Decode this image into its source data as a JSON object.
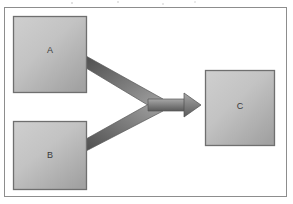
{
  "figure": {
    "type": "merge-flow-diagram",
    "frame": {
      "border_color": "#8d8d8d",
      "background_color": "#ffffff"
    },
    "nodes": [
      {
        "id": "A",
        "label": "A",
        "x": 13,
        "y": 16,
        "width": 74,
        "height": 77,
        "fill_light": "#c9c9c9",
        "fill_dark": "#9d9d9d",
        "border_color": "#6f6f6f",
        "role": "source"
      },
      {
        "id": "B",
        "label": "B",
        "x": 13,
        "y": 121,
        "width": 74,
        "height": 69,
        "fill_light": "#c9c9c9",
        "fill_dark": "#9d9d9d",
        "border_color": "#6f6f6f",
        "role": "source"
      },
      {
        "id": "C",
        "label": "C",
        "x": 205,
        "y": 70,
        "width": 70,
        "height": 76,
        "fill_light": "#c9c9c9",
        "fill_dark": "#9d9d9d",
        "border_color": "#6f6f6f",
        "role": "destination"
      }
    ],
    "connector": {
      "id": "merge-arrow",
      "kind": "merging-arrow",
      "from": [
        "A",
        "B"
      ],
      "to": "C",
      "direction": "left-to-right",
      "junction_x": 150,
      "junction_y": 105,
      "arrowhead_x": 200,
      "fill_light": "#9a9a9a",
      "fill_dark": "#5e5e5e",
      "outline_color": "#4f4f4f"
    }
  }
}
